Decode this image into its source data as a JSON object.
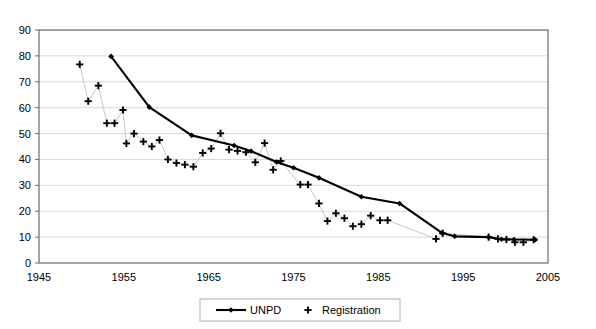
{
  "chart_data": {
    "type": "line",
    "title": "",
    "subtitle": "",
    "xlabel": "",
    "ylabel": "",
    "xlim": [
      1945,
      2005
    ],
    "ylim": [
      0,
      90
    ],
    "xticks": [
      1945,
      1955,
      1965,
      1975,
      1985,
      1995,
      2005
    ],
    "yticks": [
      0,
      10,
      20,
      30,
      40,
      50,
      60,
      70,
      80,
      90
    ],
    "grid": "horizontal",
    "legend_position": "bottom-center",
    "series": [
      {
        "name": "UNPD",
        "marker": "diamond",
        "style": "line-with-markers",
        "color": "#000000",
        "points": [
          [
            1953.5,
            79.8
          ],
          [
            1958.0,
            60.2
          ],
          [
            1963.0,
            49.3
          ],
          [
            1968.0,
            45.4
          ],
          [
            1970.0,
            43.2
          ],
          [
            1973.0,
            39.0
          ],
          [
            1975.0,
            36.8
          ],
          [
            1978.0,
            32.9
          ],
          [
            1983.0,
            25.6
          ],
          [
            1987.5,
            23.0
          ],
          [
            1992.5,
            11.6
          ],
          [
            1994.0,
            10.3
          ],
          [
            1998.0,
            10.0
          ],
          [
            1999.5,
            9.2
          ],
          [
            2001.0,
            9.1
          ],
          [
            2003.5,
            9.0
          ]
        ]
      },
      {
        "name": "Registration",
        "marker": "plus",
        "style": "markers-with-thin-line",
        "color": "#000000",
        "points": [
          [
            1949.8,
            76.7
          ],
          [
            1950.8,
            62.5
          ],
          [
            1952.0,
            68.5
          ],
          [
            1953.0,
            54.0
          ],
          [
            1953.9,
            54.0
          ],
          [
            1954.9,
            59.1
          ],
          [
            1955.3,
            46.2
          ],
          [
            1956.2,
            50.0
          ],
          [
            1957.3,
            46.9
          ],
          [
            1958.3,
            45.0
          ],
          [
            1959.2,
            47.5
          ],
          [
            1960.2,
            40.0
          ],
          [
            1961.2,
            38.6
          ],
          [
            1962.2,
            38.0
          ],
          [
            1963.2,
            37.2
          ],
          [
            1964.3,
            42.5
          ],
          [
            1965.3,
            44.2
          ],
          [
            1966.4,
            50.1
          ],
          [
            1967.4,
            43.8
          ],
          [
            1968.4,
            43.3
          ],
          [
            1969.4,
            42.8
          ],
          [
            1970.5,
            38.9
          ],
          [
            1971.6,
            46.3
          ],
          [
            1972.6,
            36.0
          ],
          [
            1973.5,
            39.4
          ],
          [
            1975.8,
            30.3
          ],
          [
            1976.7,
            30.3
          ],
          [
            1978.0,
            23.0
          ],
          [
            1979.0,
            16.2
          ],
          [
            1980.0,
            19.2
          ],
          [
            1981.0,
            17.3
          ],
          [
            1982.0,
            14.2
          ],
          [
            1983.0,
            15.0
          ],
          [
            1984.1,
            18.3
          ],
          [
            1985.2,
            16.5
          ],
          [
            1986.1,
            16.5
          ],
          [
            1991.8,
            9.3
          ],
          [
            1992.6,
            11.5
          ],
          [
            1998.0,
            10.0
          ],
          [
            1999.1,
            9.3
          ],
          [
            2000.1,
            9.1
          ],
          [
            2001.1,
            8.0
          ],
          [
            2002.1,
            8.0
          ],
          [
            2003.3,
            9.0
          ]
        ]
      }
    ]
  },
  "legend": {
    "items": [
      {
        "label": "UNPD",
        "marker": "line-diamond"
      },
      {
        "label": "Registration",
        "marker": "plus"
      }
    ]
  },
  "colors": {
    "series": "#000000",
    "grid": "#d9d9d9",
    "frame": "#808080",
    "background": "#ffffff",
    "thin_connector": "#c8c8c8"
  }
}
